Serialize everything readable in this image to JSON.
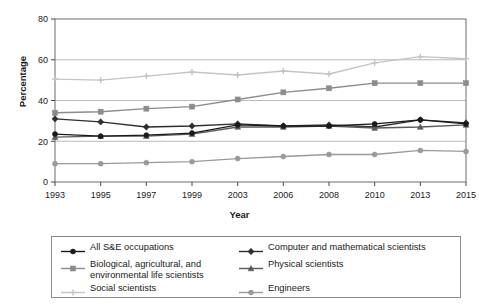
{
  "chart_data": {
    "type": "line",
    "title": "",
    "xlabel": "Year",
    "ylabel": "Percentage",
    "categories": [
      "1993",
      "1995",
      "1997",
      "1999",
      "2003",
      "2006",
      "2008",
      "2010",
      "2013",
      "2015"
    ],
    "x": [
      1993,
      1995,
      1997,
      1999,
      2003,
      2006,
      2008,
      2010,
      2013,
      2015
    ],
    "ylim": [
      0,
      80
    ],
    "yticks": [
      0,
      20,
      40,
      60,
      80
    ],
    "grid": "horizontal",
    "legend_position": "bottom",
    "series": [
      {
        "name": "All S&E occupations",
        "color": "#1a1a1a",
        "marker": "circle",
        "values": [
          23.5,
          22.5,
          23,
          24,
          28,
          27.5,
          27.5,
          28.5,
          30.5,
          28.5
        ]
      },
      {
        "name": "Computer and mathematical scientists",
        "color": "#2e2e2e",
        "marker": "diamond",
        "values": [
          31,
          29.5,
          27,
          27.5,
          28.5,
          27.5,
          28,
          27,
          30.5,
          29
        ]
      },
      {
        "name": "Biological, agricultural, and environmental life scientists",
        "color": "#8c8c8c",
        "marker": "square",
        "values": [
          34,
          34.5,
          36,
          37,
          40.5,
          44,
          46,
          48.5,
          48.5,
          48.5
        ]
      },
      {
        "name": "Physical scientists",
        "color": "#5a5a5a",
        "marker": "triangle",
        "values": [
          22,
          22.5,
          22.5,
          23.5,
          27,
          27,
          27.5,
          26.5,
          27,
          28
        ]
      },
      {
        "name": "Social scientists",
        "color": "#c4c4c4",
        "marker": "plus",
        "values": [
          50.5,
          50,
          52,
          54,
          52.5,
          54.5,
          53,
          58.5,
          61.5,
          60.5
        ]
      },
      {
        "name": "Engineers",
        "color": "#9a9a9a",
        "marker": "circle",
        "values": [
          9,
          9,
          9.5,
          10,
          11.5,
          12.5,
          13.5,
          13.5,
          15.5,
          15
        ]
      }
    ]
  },
  "legend": {
    "items": [
      {
        "label": "All S&E occupations"
      },
      {
        "label": "Computer and mathematical scientists"
      },
      {
        "label": "Biological, agricultural, and environmental life scientists"
      },
      {
        "label": "Physical scientists"
      },
      {
        "label": "Social scientists"
      },
      {
        "label": "Engineers"
      }
    ]
  },
  "axes": {
    "x_title": "Year",
    "y_title": "Percentage"
  }
}
